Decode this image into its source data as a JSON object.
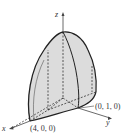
{
  "diagram": {
    "type": "3d-solid-region",
    "axes": {
      "x": "x",
      "y": "y",
      "z": "z"
    },
    "points": [
      {
        "label": "(4, 0, 0)"
      },
      {
        "label": "(0, 1, 0)"
      }
    ],
    "colors": {
      "fill": "#dcdcdc",
      "stroke": "#222222",
      "axis": "#444444"
    }
  }
}
